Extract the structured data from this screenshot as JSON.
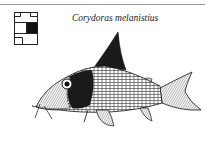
{
  "header": {
    "species_name": "Corydoras melanistius"
  },
  "icons": {
    "location_grid": "habitat-grid-icon",
    "illustration": "fish-illustration"
  },
  "colors": {
    "ink": "#1a1a1a",
    "rule": "#9a9a9a",
    "background": "#ffffff"
  }
}
